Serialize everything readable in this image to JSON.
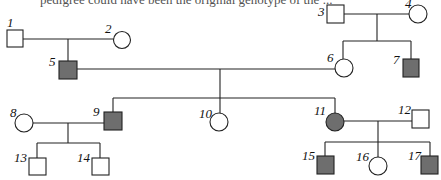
{
  "caption": "pedigree could have been the original genotype of the ...",
  "colors": {
    "line": "#222222",
    "affected_fill": "#6e6e6e",
    "unaffected_fill": "#ffffff"
  },
  "legend": {
    "square": "male",
    "circle": "female",
    "shaded": "affected"
  },
  "individuals": [
    {
      "id": "1",
      "sex": "male",
      "affected": false
    },
    {
      "id": "2",
      "sex": "female",
      "affected": false
    },
    {
      "id": "3",
      "sex": "male",
      "affected": false
    },
    {
      "id": "4",
      "sex": "female",
      "affected": false
    },
    {
      "id": "5",
      "sex": "male",
      "affected": true
    },
    {
      "id": "6",
      "sex": "female",
      "affected": false
    },
    {
      "id": "7",
      "sex": "male",
      "affected": true
    },
    {
      "id": "8",
      "sex": "female",
      "affected": false
    },
    {
      "id": "9",
      "sex": "male",
      "affected": true
    },
    {
      "id": "10",
      "sex": "female",
      "affected": false
    },
    {
      "id": "11",
      "sex": "female",
      "affected": true
    },
    {
      "id": "12",
      "sex": "male",
      "affected": false
    },
    {
      "id": "13",
      "sex": "male",
      "affected": false
    },
    {
      "id": "14",
      "sex": "male",
      "affected": false
    },
    {
      "id": "15",
      "sex": "male",
      "affected": true
    },
    {
      "id": "16",
      "sex": "female",
      "affected": false
    },
    {
      "id": "17",
      "sex": "male",
      "affected": true
    }
  ],
  "matings": [
    {
      "parents": [
        "1",
        "2"
      ],
      "children": [
        "5"
      ]
    },
    {
      "parents": [
        "3",
        "4"
      ],
      "children": [
        "6",
        "7"
      ]
    },
    {
      "parents": [
        "5",
        "6"
      ],
      "children": [
        "9",
        "10",
        "11"
      ]
    },
    {
      "parents": [
        "8",
        "9"
      ],
      "children": [
        "13",
        "14"
      ]
    },
    {
      "parents": [
        "11",
        "12"
      ],
      "children": [
        "15",
        "16",
        "17"
      ]
    }
  ],
  "labels": {
    "l1": "1",
    "l2": "2",
    "l3": "3",
    "l4": "4",
    "l5": "5",
    "l6": "6",
    "l7": "7",
    "l8": "8",
    "l9": "9",
    "l10": "10",
    "l11": "11",
    "l12": "12",
    "l13": "13",
    "l14": "14",
    "l15": "15",
    "l16": "16",
    "l17": "17"
  }
}
